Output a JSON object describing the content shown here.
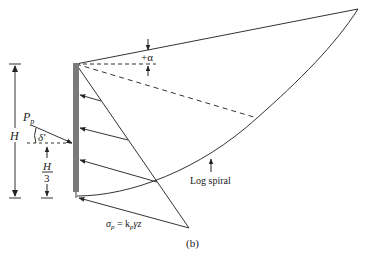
{
  "figure": {
    "caption": "(b)"
  },
  "labels": {
    "alpha": "+α",
    "passive_force": "P",
    "passive_force_sub": "p",
    "delta": "δ'",
    "height": "H",
    "height_third_num": "H",
    "height_third_den": "3",
    "log_spiral": "Log spiral",
    "pressure_sigma": "σ",
    "pressure_sigma_sub": "p",
    "pressure_eq": " = k",
    "pressure_k_sub": "p",
    "pressure_tail": "γz"
  },
  "colors": {
    "line": "#333333",
    "wall": "#7a7a7a",
    "dash": "#333333"
  }
}
